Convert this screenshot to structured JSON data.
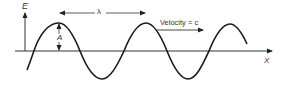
{
  "diagram": {
    "labels": {
      "y_axis": "E",
      "x_axis": "X",
      "wavelength": "λ",
      "amplitude": "A",
      "velocity": "Velocity = c"
    },
    "colors": {
      "stroke": "#1a1a1a",
      "axis": "#333333",
      "text": "#333333",
      "background": "#ffffff"
    }
  }
}
